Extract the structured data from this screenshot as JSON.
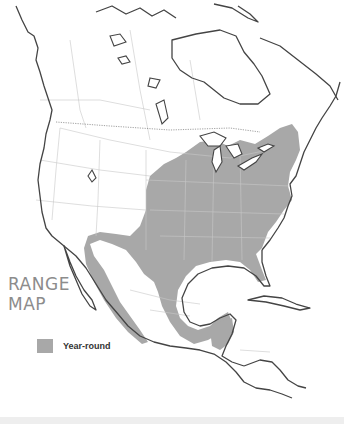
{
  "title": {
    "line1": "RANGE",
    "line2": "MAP"
  },
  "legend": {
    "items": [
      {
        "label": "Year-round",
        "color": "#a8a8a8"
      }
    ]
  },
  "map": {
    "region": "North America",
    "range_fill_color": "#a8a8a8",
    "coastline_color": "#444444",
    "border_color": "#cccccc",
    "background": "#ffffff"
  }
}
